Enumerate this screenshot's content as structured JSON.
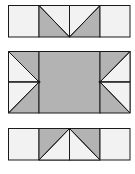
{
  "colors": {
    "background": "#ffffff",
    "light_fill": "#f2f2f2",
    "dark_fill": "#b3b3b3",
    "stroke": "#1a1a1a"
  },
  "diagram": {
    "pieces": [
      {
        "name": "top-strip",
        "cells": 4
      },
      {
        "name": "center-block",
        "cells": 3
      },
      {
        "name": "bottom-strip",
        "cells": 4
      }
    ]
  }
}
